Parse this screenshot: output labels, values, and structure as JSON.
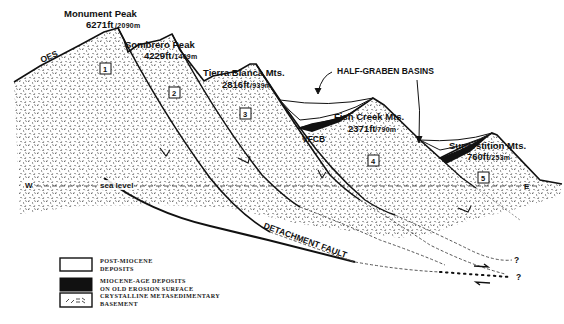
{
  "diagram": {
    "type": "geologic cross-section",
    "peaks": [
      {
        "id": 1,
        "name": "Monument Peak",
        "elev_ft": "6271ft",
        "elev_m": "/2090m"
      },
      {
        "id": 2,
        "name": "Sombrero Peak",
        "elev_ft": "4229ft",
        "elev_m": "/1409m"
      },
      {
        "id": 3,
        "name": "Tierra Blanca Mts.",
        "elev_ft": "2816ft",
        "elev_m": "/939m"
      },
      {
        "id": 4,
        "name": "Fish Creek Mts.",
        "elev_ft": "2371ft",
        "elev_m": "/790m"
      },
      {
        "id": 5,
        "name": "Superstition Mts.",
        "elev_ft": "760ft",
        "elev_m": "/253m"
      }
    ],
    "block_numbers": [
      "1",
      "2",
      "3",
      "4",
      "5"
    ],
    "labels": {
      "oes": "OES",
      "half_graben": "HALF-GRABEN BASINS",
      "vfcb": "VFCB",
      "west": "W",
      "east": "E",
      "sea_level": "sea level",
      "detachment_fault": "DETACHMENT FAULT",
      "unknown_1": "?",
      "unknown_2": "?"
    },
    "legend": [
      {
        "key": "post-miocene",
        "line1": "POST-MIOCENE",
        "line2": "DEPOSITS",
        "swatch": "white"
      },
      {
        "key": "miocene",
        "line1": "MIOCENE-AGE DEPOSITS",
        "line2": "ON OLD EROSION SURFACE",
        "swatch": "black"
      },
      {
        "key": "basement",
        "line1": "CRYSTALLINE METASEDIMENTARY",
        "line2": "BASEMENT",
        "swatch": "dash-pattern"
      }
    ],
    "colors": {
      "ink": "#111111",
      "stipple": "#3a3a3a",
      "paper": "#ffffff"
    }
  }
}
